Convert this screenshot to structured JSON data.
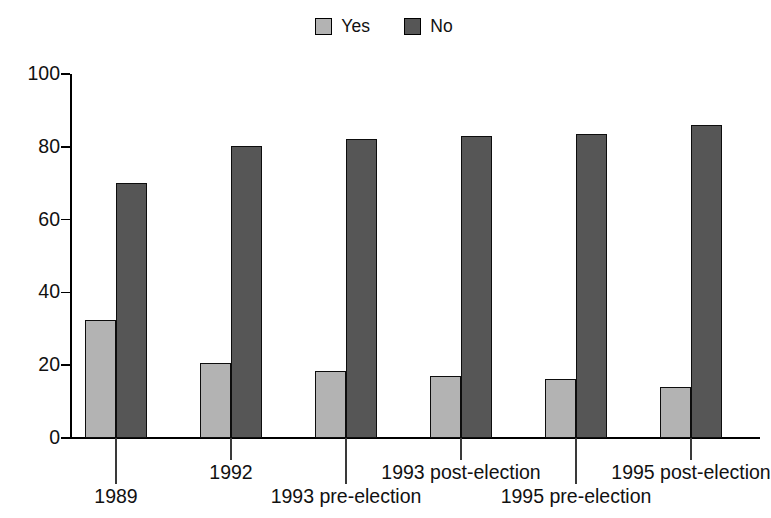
{
  "chart_data": {
    "type": "bar",
    "title": "",
    "subtitle": "",
    "xlabel": "",
    "ylabel": "",
    "ylim": [
      0,
      100
    ],
    "yticks": [
      0,
      20,
      40,
      60,
      80,
      100
    ],
    "grid": false,
    "legend_position": "top-center",
    "categories": [
      "1989",
      "1992",
      "1993 pre-election",
      "1993 post-election",
      "1995 pre-election",
      "1995 post-election"
    ],
    "series": [
      {
        "name": "Yes",
        "color": "#b3b3b3",
        "values": [
          32.5,
          20.5,
          18.5,
          17.0,
          16.3,
          14.0
        ]
      },
      {
        "name": "No",
        "color": "#565656",
        "values": [
          70.0,
          80.3,
          82.2,
          83.0,
          83.6,
          86.0
        ]
      }
    ]
  },
  "legend": {
    "items": [
      {
        "label": "Yes",
        "swatch_color": "#b3b3b3",
        "swatch_icon": "legend-swatch-icon"
      },
      {
        "label": "No",
        "swatch_color": "#565656",
        "swatch_icon": "legend-swatch-icon"
      }
    ]
  },
  "axes": {
    "y": {
      "tick_labels": [
        "100",
        "80",
        "60",
        "40",
        "20",
        "0"
      ],
      "tick_values": [
        100,
        80,
        60,
        40,
        20,
        0
      ]
    },
    "x": {
      "tick_labels": [
        "1989",
        "1992",
        "1993 pre-election",
        "1993 post-election",
        "1995 pre-election",
        "1995 post-election"
      ]
    }
  },
  "colors": {
    "yes_bar": "#b3b3b3",
    "no_bar": "#565656",
    "axis": "#000000",
    "text": "#111111",
    "background": "#ffffff"
  }
}
